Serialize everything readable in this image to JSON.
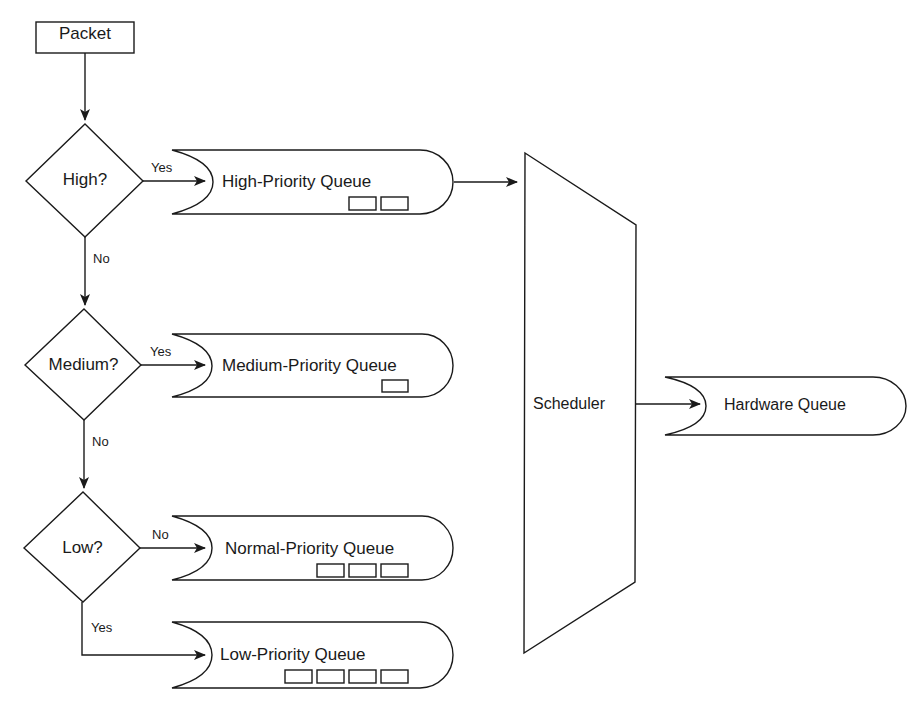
{
  "diagram": {
    "start": {
      "label": "Packet"
    },
    "decisions": [
      {
        "id": "high",
        "label": "High?",
        "yes_label": "Yes",
        "no_label": "No"
      },
      {
        "id": "medium",
        "label": "Medium?",
        "yes_label": "Yes",
        "no_label": "No"
      },
      {
        "id": "low",
        "label": "Low?",
        "right_label": "No",
        "down_label": "Yes"
      }
    ],
    "queues": [
      {
        "id": "high",
        "label": "High-Priority Queue",
        "packets": 2
      },
      {
        "id": "medium",
        "label": "Medium-Priority Queue",
        "packets": 1
      },
      {
        "id": "normal",
        "label": "Normal-Priority Queue",
        "packets": 3
      },
      {
        "id": "low",
        "label": "Low-Priority Queue",
        "packets": 4
      }
    ],
    "scheduler": {
      "label": "Scheduler"
    },
    "output": {
      "label": "Hardware Queue"
    },
    "colors": {
      "stroke": "#1a1a1a",
      "background": "#ffffff"
    }
  }
}
